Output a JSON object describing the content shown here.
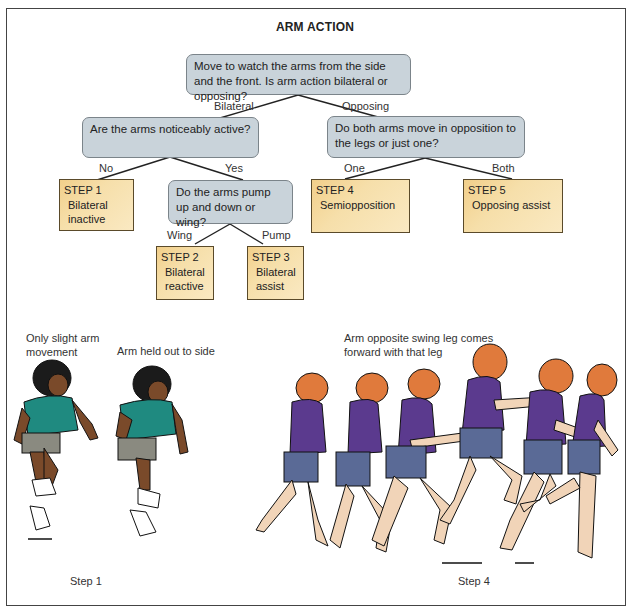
{
  "title": "ARM ACTION",
  "tree": {
    "root": {
      "text": "Move to watch the arms from the side and the front. Is arm action bilateral or opposing?"
    },
    "edges": {
      "bilateral": "Bilateral",
      "opposing": "Opposing",
      "no": "No",
      "yes": "Yes",
      "wing": "Wing",
      "pump": "Pump",
      "one": "One",
      "both": "Both"
    },
    "q_active": {
      "text": "Are the arms noticeably active?"
    },
    "q_pump": {
      "text": "Do the arms pump up and down or wing?"
    },
    "q_opposition": {
      "text": "Do both arms move in opposition to the legs or just one?"
    },
    "steps": [
      {
        "label": "STEP 1",
        "desc": "Bilateral inactive"
      },
      {
        "label": "STEP 2",
        "desc": "Bilateral reactive"
      },
      {
        "label": "STEP 3",
        "desc": "Bilateral assist"
      },
      {
        "label": "STEP 4",
        "desc": "Semiopposition"
      },
      {
        "label": "STEP 5",
        "desc": "Opposing assist"
      }
    ]
  },
  "illustrations": {
    "left": {
      "caption_a": "Only slight arm movement",
      "caption_b": "Arm held out to side",
      "step_label": "Step 1"
    },
    "right": {
      "caption": "Arm opposite swing leg comes forward with that leg",
      "step_label": "Step 4"
    }
  },
  "colors": {
    "question_fill": "#c9d3da",
    "step_fill": "#f6dfaa",
    "step_fill_dark": "#f2cf8a",
    "shirt_teal": "#1f8a80",
    "shirt_purple": "#5b3a8e",
    "shorts_blue": "#5a6a96",
    "hair_orange": "#e07a3c",
    "skin_light": "#f1d4b8",
    "skin_dark": "#7a4a2a"
  }
}
